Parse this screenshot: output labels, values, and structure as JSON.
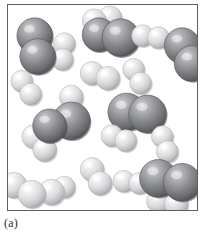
{
  "figure": {
    "caption": "(a)",
    "kind": "space-filling molecular model"
  },
  "legend": {
    "dark_atom_name": "nitrogen-atom",
    "light_atom_name": "hydrogen-atom"
  },
  "colors": {
    "dark_atom_base": "#6f7073",
    "dark_atom_mid": "#8a8b8f",
    "dark_atom_highlight": "#cfd0d2",
    "dark_atom_shadow": "#4a4b4f",
    "light_atom_base": "#c9cacd",
    "light_atom_mid": "#dedfe1",
    "light_atom_highlight": "#fbfbfc",
    "light_atom_shadow": "#9a9b9f",
    "frame_stroke": "#5d5d62",
    "background": "#ffffff",
    "caption_text": "#2b2b2b"
  },
  "chart_data": {
    "type": "scatter",
    "title": "(a)",
    "xlabel": "",
    "ylabel": "",
    "xlim": [
      0,
      191
    ],
    "ylim": [
      0,
      207
    ],
    "grid": false,
    "legend": [
      {
        "name": "nitrogen-atom",
        "color": "#8a8b8f",
        "radius": 17
      },
      {
        "name": "hydrogen-atom",
        "color": "#dedfe1",
        "radius": 11
      }
    ],
    "molecules": [
      {
        "id": "m1",
        "label": "NH3",
        "atoms": [
          {
            "element": "N",
            "x": 27,
            "y": 31,
            "r": 18
          },
          {
            "element": "N",
            "x": 30,
            "y": 52,
            "r": 18
          },
          {
            "element": "H",
            "x": 57,
            "y": 39,
            "r": 11
          },
          {
            "element": "H",
            "x": 55,
            "y": 55,
            "r": 11
          }
        ]
      },
      {
        "id": "m2",
        "label": "NH3",
        "atoms": [
          {
            "element": "H",
            "x": 87,
            "y": 16,
            "r": 12
          },
          {
            "element": "H",
            "x": 103,
            "y": 13,
            "r": 12
          },
          {
            "element": "N",
            "x": 92,
            "y": 30,
            "r": 17
          },
          {
            "element": "N",
            "x": 114,
            "y": 33,
            "r": 19
          }
        ]
      },
      {
        "id": "m3",
        "label": "H2",
        "atoms": [
          {
            "element": "H",
            "x": 136,
            "y": 31,
            "r": 11
          },
          {
            "element": "H",
            "x": 152,
            "y": 33,
            "r": 11
          }
        ]
      },
      {
        "id": "m4",
        "label": "N2",
        "atoms": [
          {
            "element": "N",
            "x": 176,
            "y": 41,
            "r": 18
          },
          {
            "element": "N",
            "x": 186,
            "y": 59,
            "r": 18
          }
        ]
      },
      {
        "id": "m5",
        "label": "H2",
        "atoms": [
          {
            "element": "H",
            "x": 85,
            "y": 69,
            "r": 12
          },
          {
            "element": "H",
            "x": 101,
            "y": 74,
            "r": 12
          }
        ]
      },
      {
        "id": "m6",
        "label": "H2",
        "atoms": [
          {
            "element": "H",
            "x": 127,
            "y": 65,
            "r": 11
          },
          {
            "element": "H",
            "x": 134,
            "y": 79,
            "r": 11
          }
        ]
      },
      {
        "id": "m7",
        "label": "H2",
        "atoms": [
          {
            "element": "H",
            "x": 14,
            "y": 77,
            "r": 11
          },
          {
            "element": "H",
            "x": 23,
            "y": 90,
            "r": 11
          }
        ]
      },
      {
        "id": "m8",
        "label": "NH3",
        "atoms": [
          {
            "element": "H",
            "x": 64,
            "y": 93,
            "r": 12
          },
          {
            "element": "N",
            "x": 64,
            "y": 117,
            "r": 19
          },
          {
            "element": "N",
            "x": 42,
            "y": 122,
            "r": 17
          },
          {
            "element": "H",
            "x": 26,
            "y": 133,
            "r": 12
          },
          {
            "element": "H",
            "x": 37,
            "y": 146,
            "r": 12
          }
        ]
      },
      {
        "id": "m9",
        "label": "N2",
        "atoms": [
          {
            "element": "N",
            "x": 120,
            "y": 108,
            "r": 19
          },
          {
            "element": "N",
            "x": 141,
            "y": 110,
            "r": 19
          }
        ]
      },
      {
        "id": "m10",
        "label": "H2",
        "atoms": [
          {
            "element": "H",
            "x": 105,
            "y": 132,
            "r": 11
          },
          {
            "element": "H",
            "x": 119,
            "y": 137,
            "r": 11
          }
        ]
      },
      {
        "id": "m11",
        "label": "H2",
        "atoms": [
          {
            "element": "H",
            "x": 156,
            "y": 133,
            "r": 11
          },
          {
            "element": "H",
            "x": 161,
            "y": 148,
            "r": 11
          }
        ]
      },
      {
        "id": "m12",
        "label": "H2",
        "atoms": [
          {
            "element": "H",
            "x": 85,
            "y": 166,
            "r": 12
          },
          {
            "element": "H",
            "x": 93,
            "y": 180,
            "r": 12
          }
        ]
      },
      {
        "id": "m13",
        "label": "NH3",
        "atoms": [
          {
            "element": "H",
            "x": 6,
            "y": 182,
            "r": 13
          },
          {
            "element": "H",
            "x": 24,
            "y": 191,
            "r": 14
          },
          {
            "element": "H",
            "x": 44,
            "y": 189,
            "r": 13
          },
          {
            "element": "H",
            "x": 57,
            "y": 184,
            "r": 11
          }
        ]
      },
      {
        "id": "m14",
        "label": "H2",
        "atoms": [
          {
            "element": "H",
            "x": 117,
            "y": 178,
            "r": 11
          },
          {
            "element": "H",
            "x": 133,
            "y": 180,
            "r": 11
          }
        ]
      },
      {
        "id": "m15",
        "label": "NH3",
        "atoms": [
          {
            "element": "N",
            "x": 152,
            "y": 175,
            "r": 19
          },
          {
            "element": "N",
            "x": 176,
            "y": 179,
            "r": 19
          },
          {
            "element": "H",
            "x": 152,
            "y": 198,
            "r": 12
          },
          {
            "element": "H",
            "x": 170,
            "y": 201,
            "r": 12
          }
        ]
      }
    ]
  }
}
